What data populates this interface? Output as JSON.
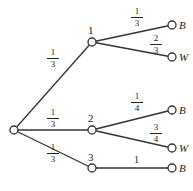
{
  "diagram": {
    "type": "probability-tree",
    "root": {
      "label": ""
    },
    "level1": [
      {
        "label": "1",
        "edge_prob": {
          "num": "1",
          "den": "3"
        }
      },
      {
        "label": "2",
        "edge_prob": {
          "num": "1",
          "den": "3"
        }
      },
      {
        "label": "3",
        "edge_prob": {
          "num": "1",
          "den": "3"
        }
      }
    ],
    "leaves": [
      {
        "parent": "1",
        "label": "B",
        "edge_prob": {
          "num": "1",
          "den": "3"
        }
      },
      {
        "parent": "1",
        "label": "W",
        "edge_prob": {
          "num": "2",
          "den": "3"
        }
      },
      {
        "parent": "2",
        "label": "B",
        "edge_prob": {
          "num": "1",
          "den": "4"
        }
      },
      {
        "parent": "2",
        "label": "W",
        "edge_prob": {
          "num": "3",
          "den": "4"
        }
      },
      {
        "parent": "3",
        "label": "B",
        "edge_prob": {
          "plain": "1"
        }
      }
    ]
  }
}
